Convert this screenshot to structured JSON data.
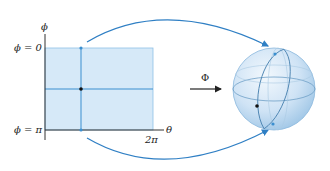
{
  "diagram": {
    "domain_axis": {
      "vertical_label": "ϕ",
      "horizontal_label": "θ"
    },
    "labels": {
      "phi_top": "ϕ = 0",
      "phi_bottom": "ϕ = π",
      "theta_max": "2π",
      "map_name": "Φ"
    },
    "colors": {
      "fill": "#d6e9f8",
      "line_blue": "#3b8fd0",
      "arc_blue": "#2f7fc4",
      "axis": "#333333",
      "dot": "#111111",
      "sphere_fill": "#cfe3f5",
      "sphere_edge": "#7fb0d8"
    }
  }
}
